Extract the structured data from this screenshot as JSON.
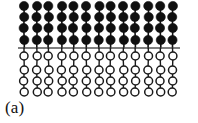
{
  "figure": {
    "label": "(a)",
    "type": "molecular-bilayer-schematic",
    "width": 198,
    "height": 123,
    "background_color": "#ffffff"
  },
  "diagram": {
    "column_count": 13,
    "first_column_x": 24,
    "column_spacing": 12.4,
    "jitter_x": [
      0,
      0.4,
      -0.3,
      0.5,
      -0.2,
      0.3,
      0.6,
      -0.4,
      0.2,
      -0.5,
      0.3,
      0,
      -0.3
    ],
    "upper_layer": {
      "name": "filled-chain-layer",
      "fill_color": "#101010",
      "stroke_color": "#101010",
      "circle_radius": 4.6,
      "bond_width": 1.6,
      "rows": 4,
      "row_y": [
        6,
        17,
        28,
        40
      ],
      "row_jitter": [
        [
          0,
          0.3,
          -0.2,
          0.4,
          0,
          -0.3,
          0.5,
          0.2,
          -0.4,
          0.3,
          0,
          -0.2,
          0.4
        ],
        [
          0.2,
          -0.3,
          0.4,
          0,
          0.3,
          -0.4,
          0.2,
          0.5,
          0,
          -0.2,
          0.4,
          0.3,
          -0.3
        ],
        [
          -0.3,
          0.4,
          0,
          0.3,
          -0.4,
          0.2,
          0,
          0.4,
          0.3,
          -0.3,
          0.2,
          -0.4,
          0.3
        ],
        [
          0.3,
          0,
          -0.4,
          0.2,
          0.4,
          0,
          -0.3,
          0.2,
          0.5,
          0.3,
          -0.2,
          0.4,
          0
        ]
      ]
    },
    "interface_line": {
      "name": "interface-boundary",
      "color": "#555555",
      "thickness": 1.7,
      "y": 48,
      "x_start": 18,
      "x_end": 180
    },
    "lower_layer": {
      "name": "open-chain-layer",
      "fill_color": "#ffffff",
      "stroke_color": "#1a1a1a",
      "circle_radius": 4.0,
      "stroke_width": 1.5,
      "bond_width": 1.4,
      "rows": 4,
      "row_y": [
        56,
        70,
        81,
        92
      ],
      "row_jitter": [
        [
          0,
          0.4,
          -0.3,
          0.2,
          0.5,
          -0.2,
          0.3,
          0,
          -0.4,
          0.3,
          0.2,
          -0.3,
          0.4
        ],
        [
          0.3,
          -0.2,
          0.5,
          -0.3,
          0.2,
          0.4,
          0,
          -0.3,
          0.4,
          0.2,
          -0.4,
          0.3,
          0
        ],
        [
          -0.4,
          0.3,
          0.2,
          0.5,
          -0.3,
          0,
          0.4,
          0.2,
          -0.2,
          0.5,
          0.3,
          -0.4,
          0.2
        ],
        [
          0.2,
          0.5,
          -0.4,
          0.3,
          0,
          0.4,
          -0.3,
          0.5,
          0.2,
          -0.2,
          0.4,
          0.3,
          -0.3
        ]
      ]
    }
  }
}
